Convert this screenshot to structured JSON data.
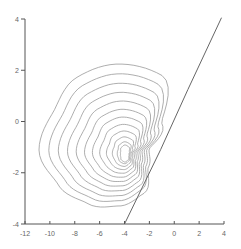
{
  "chart_data": {
    "type": "contour",
    "title": "",
    "xlabel": "",
    "ylabel": "",
    "xlim": [
      -12,
      4
    ],
    "ylim": [
      -4,
      4
    ],
    "grid": false,
    "legend": null,
    "x_ticks": [
      -12,
      -10,
      -8,
      -6,
      -4,
      -2,
      0,
      2,
      4
    ],
    "y_ticks": [
      -4,
      -2,
      0,
      2,
      4
    ],
    "x_tick_labels": [
      "-12",
      "-10",
      "-8",
      "-6",
      "-4",
      "-2",
      "0",
      "2",
      "4"
    ],
    "y_tick_labels": [
      "-4",
      "-2",
      "0",
      "2",
      "4"
    ],
    "contour": {
      "levels": 12,
      "center": [
        -4.0,
        -1.3
      ],
      "outer_extent": {
        "x_min": -10.3,
        "x_max": -1.5,
        "y_min": -3.4,
        "y_max": 2.0
      },
      "color": "#999999"
    },
    "line": {
      "points": [
        [
          -4.0,
          -4.0
        ],
        [
          -1.1,
          -1.1
        ],
        [
          1.1,
          1.25
        ],
        [
          3.8,
          4.05
        ]
      ],
      "color": "#666666"
    },
    "axis_color": "#555555"
  }
}
